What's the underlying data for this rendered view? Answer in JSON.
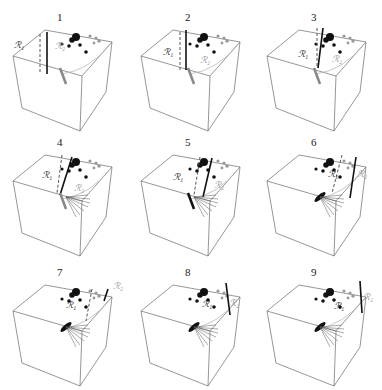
{
  "figure": {
    "region_labels": {
      "r1": "ℛ₁",
      "r2": "ℛ₂"
    },
    "colors": {
      "edge": "#6a6a6a",
      "dark": "#111111",
      "grey": "#9a9a9a"
    },
    "panels": [
      {
        "id": "1",
        "label": "1",
        "ox": 0,
        "oy": 0,
        "boundary": {
          "solid": [
            [
              47,
              32
            ],
            [
              47,
              74
            ]
          ],
          "dashed": [
            [
              40,
              34
            ],
            [
              40,
              72
            ]
          ]
        },
        "r1_pos": [
          14,
          41
        ],
        "r2_pos": [
          55,
          42
        ],
        "r2_color": "grey",
        "stem": "grey",
        "fan": false
      },
      {
        "id": "2",
        "label": "2",
        "ox": 128,
        "oy": 0,
        "boundary": {
          "solid": [
            [
              58,
              30
            ],
            [
              58,
              70
            ]
          ],
          "dashed": [
            [
              52,
              32
            ],
            [
              52,
              70
            ]
          ]
        },
        "r1_pos": [
          35,
          48
        ],
        "r2_pos": [
          72,
          56
        ],
        "r2_color": "grey",
        "stem": "grey",
        "fan": false
      },
      {
        "id": "3",
        "label": "3",
        "ox": 254,
        "oy": 0,
        "boundary": {
          "solid": [
            [
              69,
              28
            ],
            [
              64,
              68
            ]
          ],
          "dashed": [
            [
              63,
              28
            ],
            [
              63,
              68
            ]
          ]
        },
        "r1_pos": [
          44,
          50
        ],
        "r2_pos": [
          78,
          55
        ],
        "r2_color": "grey",
        "stem": "grey",
        "fan": false
      },
      {
        "id": "4",
        "label": "4",
        "ox": 0,
        "oy": 125,
        "boundary": {
          "solid": [
            [
              72,
              32
            ],
            [
              60,
              70
            ]
          ],
          "dashed": [
            [
              62,
              30
            ],
            [
              57,
              68
            ]
          ]
        },
        "r1_pos": [
          42,
          46
        ],
        "r2_pos": [
          74,
          59
        ],
        "r2_color": "grey",
        "stem": "grey",
        "fan": true
      },
      {
        "id": "5",
        "label": "5",
        "ox": 128,
        "oy": 125,
        "boundary": {
          "solid": [
            [
              84,
              33
            ],
            [
              75,
              72
            ]
          ],
          "dashed": [
            [
              72,
              32
            ],
            [
              66,
              70
            ]
          ]
        },
        "r1_pos": [
          45,
          48
        ],
        "r2_pos": [
          86,
          56
        ],
        "r2_color": "grey",
        "stem": "dark",
        "fan": true
      },
      {
        "id": "6",
        "label": "6",
        "ox": 254,
        "oy": 125,
        "boundary": {
          "solid": [
            [
              102,
              32
            ],
            [
              96,
              73
            ]
          ],
          "dashed": [
            [
              88,
              30
            ],
            [
              78,
              68
            ]
          ]
        },
        "r1_pos": [
          74,
          45
        ],
        "r2_pos": [
          103,
          45
        ],
        "r2_color": "grey",
        "stem": "dark",
        "fan": true
      },
      {
        "id": "7",
        "label": "7",
        "ox": 0,
        "oy": 255,
        "boundary": {
          "solid": [
            [
              108,
              34
            ],
            [
              104,
              46
            ]
          ],
          "dashed": [
            [
              92,
              34
            ],
            [
              86,
              66
            ]
          ]
        },
        "r1_pos": [
          66,
          46
        ],
        "r2_pos": [
          113,
          27
        ],
        "r2_color": "grey",
        "stem": "dark",
        "fan": true
      },
      {
        "id": "8",
        "label": "8",
        "ox": 128,
        "oy": 255,
        "boundary": {
          "solid": [
            [
              98,
              28
            ],
            [
              102,
              60
            ]
          ],
          "dashed": null
        },
        "r1_pos": [
          74,
          45
        ],
        "r2_pos": [
          101,
          44
        ],
        "r2_color": "grey",
        "stem": "dark",
        "fan": true
      },
      {
        "id": "9",
        "label": "9",
        "ox": 254,
        "oy": 255,
        "boundary": {
          "solid": [
            [
              106,
              26
            ],
            [
              108,
              58
            ]
          ],
          "dashed": null
        },
        "r1_pos": [
          80,
          47
        ],
        "r2_pos": [
          109,
          38
        ],
        "r2_color": "grey",
        "stem": "dark",
        "fan": true
      }
    ]
  }
}
